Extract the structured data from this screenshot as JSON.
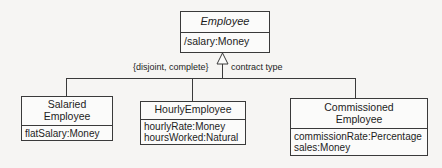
{
  "diagram": {
    "type": "uml-class-diagram",
    "superclass": {
      "name": "Employee",
      "abstract": true,
      "attributes": [
        "/salary:Money"
      ]
    },
    "generalization": {
      "constraint_label": "{disjoint, complete}",
      "discriminator_label": "contract type",
      "arrow": "hollow-triangle"
    },
    "subclasses": [
      {
        "name": "Salaried\nEmployee",
        "attributes": [
          "flatSalary:Money"
        ]
      },
      {
        "name": "HourlyEmployee",
        "attributes": [
          "hourlyRate:Money",
          "hoursWorked:Natural"
        ]
      },
      {
        "name": "Commissioned\nEmployee",
        "attributes": [
          "commissionRate:Percentage",
          "sales:Money"
        ]
      }
    ]
  },
  "colors": {
    "background": "#f6f5f3",
    "box_fill": "#fbfbfa",
    "line": "#3a3a3a",
    "text": "#1d1d1d"
  }
}
